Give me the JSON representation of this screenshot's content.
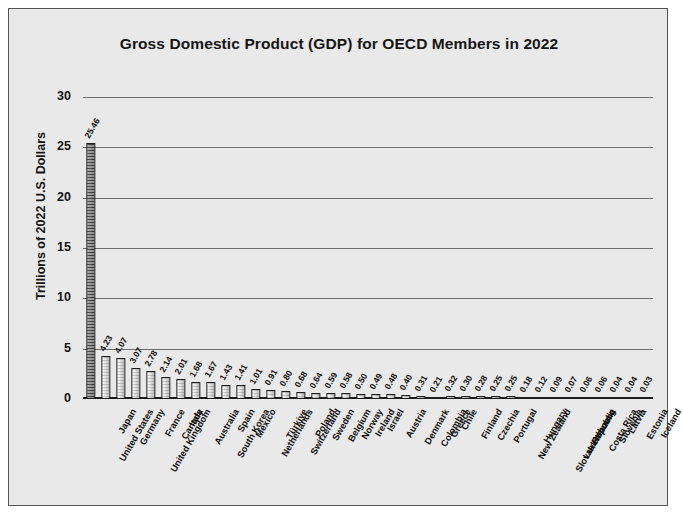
{
  "chart_data": {
    "type": "bar",
    "title": "Gross Domestic Product (GDP) for OECD Members in 2022",
    "xlabel": "",
    "ylabel": "Trillions of 2022 U.S. Dollars",
    "ylim": [
      0,
      30
    ],
    "yticks": [
      0,
      5,
      10,
      15,
      20,
      25,
      30
    ],
    "grid": true,
    "legend": false,
    "categories": [
      "United States",
      "Japan",
      "Germany",
      "United Kingdom",
      "France",
      "Canada",
      "Italy",
      "Australia",
      "South Korea",
      "Spain",
      "Mexico",
      "Netherlands",
      "Türkiye",
      "Switzerland",
      "Poland",
      "Sweden",
      "Belgium",
      "Norway",
      "Ireland",
      "Israel",
      "Austria",
      "Denmark",
      "Colombia",
      "Greece",
      "Chile",
      "Finland",
      "Czechia",
      "Portugal",
      "New Zealand",
      "Hungary",
      "Slovak Republic",
      "Luxembourg",
      "Lithuania",
      "Costa Rica",
      "Slovenia",
      "Latvia",
      "Estonia",
      "Iceland"
    ],
    "values": [
      25.46,
      4.23,
      4.07,
      3.07,
      2.78,
      2.14,
      2.01,
      1.68,
      1.67,
      1.43,
      1.41,
      1.01,
      0.91,
      0.8,
      0.68,
      0.64,
      0.59,
      0.58,
      0.5,
      0.49,
      0.48,
      0.4,
      0.31,
      0.21,
      0.32,
      0.3,
      0.28,
      0.25,
      0.25,
      0.18,
      0.12,
      0.09,
      0.07,
      0.06,
      0.06,
      0.04,
      0.04,
      0.03
    ],
    "value_labels": [
      "25.46",
      "4.23",
      "4.07",
      "3.07",
      "2.78",
      "2.14",
      "2.01",
      "1.68",
      "1.67",
      "1.43",
      "1.41",
      "1.01",
      "0.91",
      "0.80",
      "0.68",
      "0.64",
      "0.59",
      "0.58",
      "0.50",
      "0.49",
      "0.48",
      "0.40",
      "0.31",
      "0.21",
      "0.32",
      "0.30",
      "0.28",
      "0.25",
      "0.25",
      "0.18",
      "0.12",
      "0.09",
      "0.07",
      "0.06",
      "0.06",
      "0.04",
      "0.04",
      "0.03"
    ],
    "colors": {
      "background": "#e9e9e9",
      "bar_fill": "#dcdcdc",
      "bar_edge": "#1d1d1d",
      "highlight_bar": "#6f6f6f",
      "gridline": "#6d6d6d",
      "text": "#101010"
    }
  }
}
